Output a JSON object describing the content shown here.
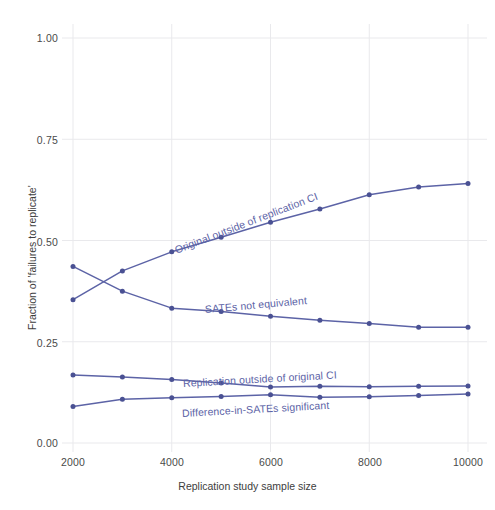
{
  "chart_data": {
    "type": "line",
    "title": "",
    "xlabel": "Replication study sample size",
    "ylabel": "Fraction of 'failures to replicate'",
    "xlim": [
      1500,
      10500
    ],
    "ylim": [
      0.0,
      1.05
    ],
    "xticks": [
      2000,
      4000,
      6000,
      8000,
      10000
    ],
    "xticklabels": [
      "2000",
      "4000",
      "6000",
      "8000",
      "10000"
    ],
    "yticks": [
      0.0,
      0.25,
      0.5,
      0.75,
      1.0
    ],
    "yticklabels": [
      "0.00",
      "0.25",
      "0.50",
      "0.75",
      "1.00"
    ],
    "grid": true,
    "legend_position": "inline-labels",
    "line_color": "#5c63a6",
    "marker_color": "#4a5193",
    "x": [
      2000,
      3000,
      4000,
      5000,
      6000,
      7000,
      8000,
      9000,
      10000
    ],
    "series": [
      {
        "name": "Original outside of replication CI",
        "label": "Original outside of replication CI",
        "values": [
          0.354,
          0.425,
          0.472,
          0.508,
          0.545,
          0.578,
          0.613,
          0.632,
          0.641
        ]
      },
      {
        "name": "SATEs not equivalent",
        "label": "SATEs not equivalent",
        "values": [
          0.436,
          0.375,
          0.333,
          0.325,
          0.313,
          0.303,
          0.295,
          0.286,
          0.286
        ]
      },
      {
        "name": "Replication outside of original CI",
        "label": "Replication outside of original CI",
        "values": [
          0.168,
          0.163,
          0.157,
          0.148,
          0.138,
          0.14,
          0.139,
          0.14,
          0.141
        ]
      },
      {
        "name": "Difference-in-SATEs significant",
        "label": "Difference-in-SATEs significant",
        "values": [
          0.09,
          0.108,
          0.112,
          0.115,
          0.119,
          0.113,
          0.114,
          0.117,
          0.121
        ]
      }
    ]
  },
  "labels": {
    "y_axis_title": "Fraction of 'failures to replicate'",
    "x_axis_title": "Replication study sample size",
    "series_1": "Original outside of replication CI",
    "series_2": "SATEs not equivalent",
    "series_3": "Replication outside of original CI",
    "series_4": "Difference-in-SATEs significant",
    "ytick_0": "0.00",
    "ytick_1": "0.25",
    "ytick_2": "0.50",
    "ytick_3": "0.75",
    "ytick_4": "1.00",
    "xtick_0": "2000",
    "xtick_1": "4000",
    "xtick_2": "6000",
    "xtick_3": "8000",
    "xtick_4": "10000"
  }
}
